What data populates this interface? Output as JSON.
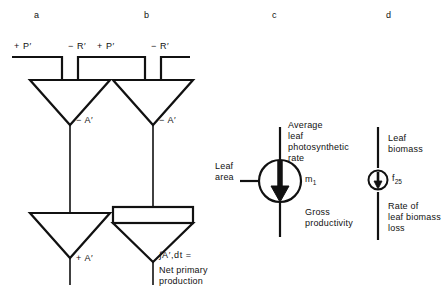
{
  "figure": {
    "panels": [
      {
        "id": "a",
        "letter": "a",
        "inputs": [
          {
            "name": "gross-photosynthesis",
            "label": "+ P′"
          },
          {
            "name": "respiration",
            "label": "− R′"
          }
        ],
        "nodes": [
          {
            "name": "upper-triangle-negative",
            "label": "− A′"
          },
          {
            "name": "lower-triangle-positive",
            "label": "+ A′"
          }
        ]
      },
      {
        "id": "b",
        "letter": "b",
        "inputs": [
          {
            "name": "gross-photosynthesis",
            "label": "+ P′"
          },
          {
            "name": "respiration",
            "label": "− R′"
          }
        ],
        "nodes": [
          {
            "name": "upper-triangle-negative",
            "label": "− A′"
          },
          {
            "name": "integrator-tank",
            "label": "∫A′,dt ="
          }
        ],
        "caption": "Net primary\nproduction"
      },
      {
        "id": "c",
        "letter": "c",
        "labels": {
          "top_input": "Average\nleaf\nphotosynthetic\nrate",
          "side_input": "Leaf\narea",
          "output": "Gross\nproductivity",
          "symbol": "m",
          "symbol_subscript": "1"
        }
      },
      {
        "id": "d",
        "letter": "d",
        "labels": {
          "top_input": "Leaf\nbiomass",
          "output": "Rate of\nleaf biomass\nloss",
          "symbol": "f",
          "symbol_subscript": "25"
        }
      }
    ],
    "style": {
      "stroke": "#111111",
      "background": "#ffffff"
    }
  }
}
